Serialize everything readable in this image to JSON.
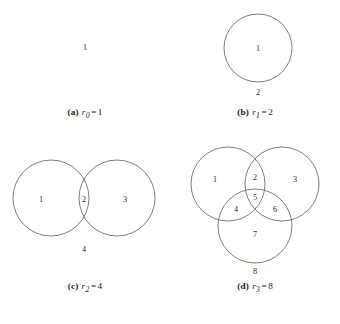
{
  "figure": {
    "stroke_color": "#6f6f73",
    "label_color": "#2b2b2b",
    "background_color": "#ffffff"
  },
  "panels": [
    {
      "key": "a",
      "tag": "(a)",
      "symbol": "r",
      "subscript": "0",
      "equals": "=",
      "value": "1",
      "circle_count": 0,
      "region_labels": [
        "1"
      ],
      "caption_text": "(a) r0 = 1"
    },
    {
      "key": "b",
      "tag": "(b)",
      "symbol": "r",
      "subscript": "1",
      "equals": "=",
      "value": "2",
      "circle_count": 1,
      "region_labels": [
        "1",
        "2"
      ],
      "caption_text": "(b) r1 = 2"
    },
    {
      "key": "c",
      "tag": "(c)",
      "symbol": "r",
      "subscript": "2",
      "equals": "=",
      "value": "4",
      "circle_count": 2,
      "region_labels": [
        "1",
        "2",
        "3",
        "4"
      ],
      "caption_text": "(c) r2 = 4"
    },
    {
      "key": "d",
      "tag": "(d)",
      "symbol": "r",
      "subscript": "3",
      "equals": "=",
      "value": "8",
      "circle_count": 3,
      "region_labels": [
        "1",
        "2",
        "3",
        "4",
        "5",
        "6",
        "7",
        "8"
      ],
      "caption_text": "(d) r3 = 8"
    }
  ],
  "regions": {
    "a": {
      "plane": "1"
    },
    "b": {
      "inside": "1",
      "outside": "2"
    },
    "c": {
      "left_only": "1",
      "overlap": "2",
      "right_only": "3",
      "outside": "4"
    },
    "d": {
      "left_only": "1",
      "left_top_overlap": "2",
      "right_only": "3",
      "left_bottom_overlap": "4",
      "center_triple": "5",
      "right_bottom_overlap": "6",
      "bottom_only": "7",
      "outside": "8"
    }
  }
}
